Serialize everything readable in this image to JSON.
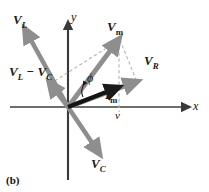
{
  "figure": {
    "caption": "(b)",
    "type": "phasor-diagram",
    "background": "#ffffff",
    "vector_color": "#8e8e8e",
    "current_vector_color": "#1a1a1a",
    "axis_color": "#6e6e6e",
    "dashed_color": "#b0b0b0"
  },
  "axes": {
    "x_label": "x",
    "y_label": "y",
    "origin": [
      68,
      107
    ],
    "x_range": [
      10,
      188
    ],
    "y_range": [
      22,
      180
    ]
  },
  "labels": {
    "v_l": {
      "base": "V",
      "sub": "L"
    },
    "v_c": {
      "base": "V",
      "sub": "C"
    },
    "v_r": {
      "base": "V",
      "sub": "R"
    },
    "v_m": {
      "base": "V",
      "sub": "m"
    },
    "i_m": {
      "base": "I",
      "sub": "m"
    },
    "v_l_minus_v_c": {
      "text": "V",
      "sub1": "L",
      "op": " − ",
      "text2": "V",
      "sub2": "C"
    },
    "phi": "ϕ",
    "projection": "v"
  },
  "vectors": [
    {
      "name": "V_L",
      "from": [
        68,
        107
      ],
      "to": [
        25,
        31
      ],
      "color": "#8e8e8e"
    },
    {
      "name": "V_C",
      "from": [
        68,
        107
      ],
      "to": [
        99,
        153
      ],
      "color": "#8e8e8e"
    },
    {
      "name": "V_L_minus_V_C",
      "from": [
        68,
        107
      ],
      "to": [
        50,
        83
      ],
      "color": "#8e8e8e"
    },
    {
      "name": "V_m",
      "from": [
        68,
        107
      ],
      "to": [
        119,
        39
      ],
      "color": "#8e8e8e"
    },
    {
      "name": "V_R",
      "from": [
        68,
        107
      ],
      "to": [
        136,
        81
      ],
      "color": "#8e8e8e"
    },
    {
      "name": "I_m",
      "from": [
        68,
        107
      ],
      "to": [
        117,
        88
      ],
      "color": "#1a1a1a"
    }
  ],
  "dashed_lines": [
    {
      "name": "vm-to-xaxis",
      "from": [
        119,
        39
      ],
      "to": [
        119,
        110
      ]
    },
    {
      "name": "vm-to-vr",
      "from": [
        119,
        39
      ],
      "to": [
        136,
        81
      ]
    },
    {
      "name": "vlc-to-vm",
      "from": [
        50,
        83
      ],
      "to": [
        119,
        39
      ]
    }
  ]
}
